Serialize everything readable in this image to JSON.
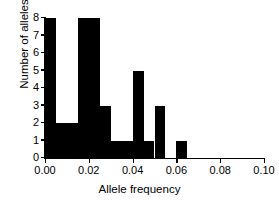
{
  "chart_data": {
    "type": "bar",
    "title": "",
    "subtitle": "",
    "xlabel": "Allele frequency",
    "ylabel": "Number of alleles",
    "xlim": [
      0.0,
      0.1
    ],
    "ylim": [
      0,
      8
    ],
    "bin_width": 0.005,
    "grid": false,
    "legend": null,
    "bar_color": "#000000",
    "axis_color": "#000000",
    "xticks": [
      0.0,
      0.02,
      0.04,
      0.06,
      0.08,
      0.1
    ],
    "xticklabels": [
      "0.00",
      "0.02",
      "0.04",
      "0.06",
      "0.08",
      "0.10"
    ],
    "yticks": [
      0,
      1,
      2,
      3,
      4,
      5,
      6,
      7,
      8
    ],
    "yticklabels": [
      "0",
      "1",
      "2",
      "3",
      "4",
      "5",
      "6",
      "7",
      "8"
    ],
    "bins": [
      {
        "x0": 0.0,
        "x1": 0.005,
        "count": 8
      },
      {
        "x0": 0.005,
        "x1": 0.01,
        "count": 2
      },
      {
        "x0": 0.01,
        "x1": 0.015,
        "count": 2
      },
      {
        "x0": 0.015,
        "x1": 0.02,
        "count": 8
      },
      {
        "x0": 0.02,
        "x1": 0.025,
        "count": 8
      },
      {
        "x0": 0.025,
        "x1": 0.03,
        "count": 3
      },
      {
        "x0": 0.03,
        "x1": 0.035,
        "count": 1
      },
      {
        "x0": 0.035,
        "x1": 0.04,
        "count": 1
      },
      {
        "x0": 0.04,
        "x1": 0.045,
        "count": 5
      },
      {
        "x0": 0.045,
        "x1": 0.05,
        "count": 1
      },
      {
        "x0": 0.05,
        "x1": 0.055,
        "count": 3
      },
      {
        "x0": 0.055,
        "x1": 0.06,
        "count": 0
      },
      {
        "x0": 0.06,
        "x1": 0.065,
        "count": 1
      },
      {
        "x0": 0.065,
        "x1": 0.07,
        "count": 0
      },
      {
        "x0": 0.07,
        "x1": 0.075,
        "count": 0
      },
      {
        "x0": 0.075,
        "x1": 0.08,
        "count": 0
      },
      {
        "x0": 0.08,
        "x1": 0.085,
        "count": 0
      },
      {
        "x0": 0.085,
        "x1": 0.09,
        "count": 0
      },
      {
        "x0": 0.09,
        "x1": 0.095,
        "count": 0
      },
      {
        "x0": 0.095,
        "x1": 0.1,
        "count": 0
      }
    ],
    "categories": [
      "0.000-0.005",
      "0.005-0.010",
      "0.010-0.015",
      "0.015-0.020",
      "0.020-0.025",
      "0.025-0.030",
      "0.030-0.035",
      "0.035-0.040",
      "0.040-0.045",
      "0.045-0.050",
      "0.050-0.055",
      "0.055-0.060",
      "0.060-0.065",
      "0.065-0.070",
      "0.070-0.075",
      "0.075-0.080",
      "0.080-0.085",
      "0.085-0.090",
      "0.090-0.095",
      "0.095-0.100"
    ],
    "values": [
      8,
      2,
      2,
      8,
      8,
      3,
      1,
      1,
      5,
      1,
      3,
      0,
      1,
      0,
      0,
      0,
      0,
      0,
      0,
      0
    ]
  }
}
